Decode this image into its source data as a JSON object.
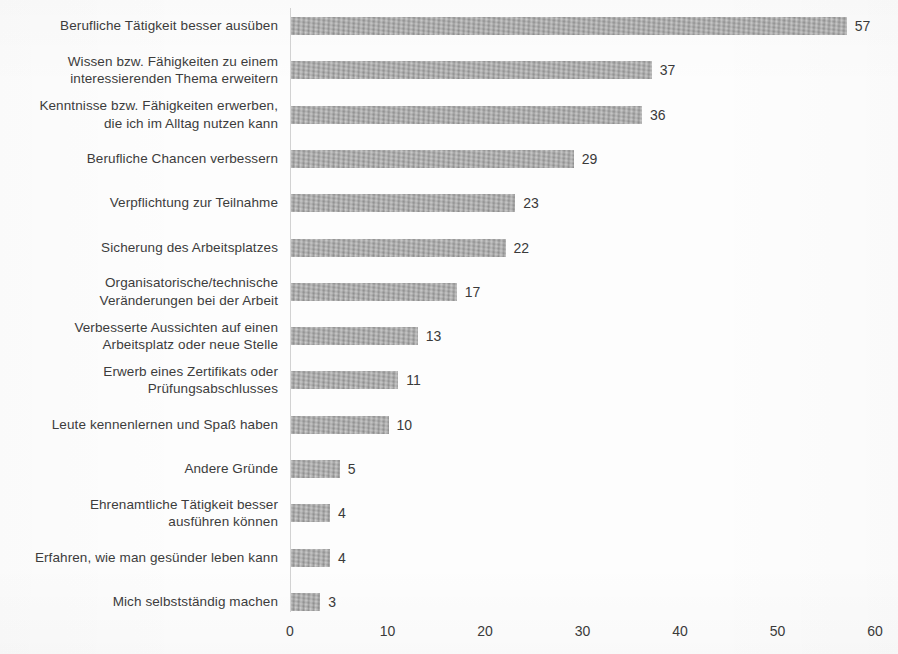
{
  "chart_data": {
    "type": "bar",
    "orientation": "horizontal",
    "title": "",
    "subtitle": "",
    "xlabel": "",
    "ylabel": "",
    "xlim": [
      0,
      60
    ],
    "xticks": [
      0,
      10,
      20,
      30,
      40,
      50,
      60
    ],
    "xtick_labels": [
      "0",
      "10",
      "20",
      "30",
      "40",
      "50",
      "60"
    ],
    "grid": false,
    "legend": null,
    "bar_color": "#a9a9a9",
    "categories": [
      "Berufliche Tätigkeit besser ausüben",
      "Wissen bzw. Fähigkeiten zu einem\ninteressierenden Thema erweitern",
      "Kenntnisse bzw. Fähigkeiten erwerben,\ndie ich im Alltag nutzen kann",
      "Berufliche Chancen verbessern",
      "Verpflichtung zur Teilnahme",
      "Sicherung des Arbeitsplatzes",
      "Organisatorische/technische\nVeränderungen bei der Arbeit",
      "Verbesserte Aussichten auf einen\nArbeitsplatz oder neue Stelle",
      "Erwerb eines Zertifikats oder\nPrüfungsabschlusses",
      "Leute kennenlernen und Spaß haben",
      "Andere Gründe",
      "Ehrenamtliche Tätigkeit besser\nausführen können",
      "Erfahren, wie man gesünder leben kann",
      "Mich selbstständig machen"
    ],
    "values": [
      57,
      37,
      36,
      29,
      23,
      22,
      17,
      13,
      11,
      10,
      5,
      4,
      4,
      3
    ],
    "value_labels": [
      "57",
      "37",
      "36",
      "29",
      "23",
      "22",
      "17",
      "13",
      "11",
      "10",
      "5",
      "4",
      "4",
      "3"
    ]
  }
}
